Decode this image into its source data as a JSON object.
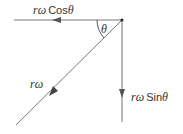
{
  "diagram": {
    "type": "vector-resolution",
    "colors": {
      "line": "#555555",
      "text": "#333333"
    },
    "origin": {
      "x": 122,
      "y": 20
    },
    "vectors": [
      {
        "id": "resultant",
        "label_var": "rω",
        "label_fn": "",
        "direction": "down-left diagonal"
      },
      {
        "id": "horizontal",
        "label_var": "rω",
        "label_fn": "Cos",
        "label_angle": "θ",
        "direction": "left"
      },
      {
        "id": "vertical",
        "label_var": "rω",
        "label_fn": "Sin",
        "label_angle": "θ",
        "direction": "down"
      }
    ],
    "angle_label": "θ"
  }
}
